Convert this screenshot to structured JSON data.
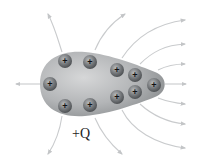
{
  "diagram": {
    "charge_label": "+Q",
    "charge_symbol": "+",
    "colors": {
      "conductor": "#a9abad",
      "charge": "#6f7274",
      "field_lines": "#c9cbcd",
      "background": "#ffffff"
    },
    "charges": [
      {
        "x": 65,
        "y": 61
      },
      {
        "x": 90,
        "y": 62
      },
      {
        "x": 50,
        "y": 84
      },
      {
        "x": 65,
        "y": 106
      },
      {
        "x": 90,
        "y": 105
      },
      {
        "x": 117,
        "y": 70
      },
      {
        "x": 135,
        "y": 75
      },
      {
        "x": 154,
        "y": 85
      },
      {
        "x": 135,
        "y": 92
      },
      {
        "x": 117,
        "y": 97
      }
    ]
  }
}
